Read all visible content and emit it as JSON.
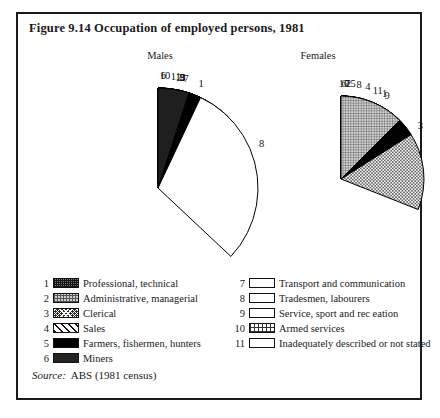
{
  "figure": {
    "title": "Figure 9.14  Occupation of employed persons, 1981",
    "source_label": "Source:",
    "source_value": "ABS (1981 census)"
  },
  "panels": {
    "males_heading": "Males",
    "females_heading": "Females"
  },
  "legend": {
    "left": [
      {
        "num": "1",
        "pattern": "p1",
        "label": "Professional, technical"
      },
      {
        "num": "2",
        "pattern": "p2",
        "label": "Administrative, managerial"
      },
      {
        "num": "3",
        "pattern": "p3",
        "label": "Clerical"
      },
      {
        "num": "4",
        "pattern": "p4",
        "label": "Sales"
      },
      {
        "num": "5",
        "pattern": "p5",
        "label": "Farmers, fishermen, hunters"
      },
      {
        "num": "6",
        "pattern": "p6",
        "label": "Miners"
      }
    ],
    "right": [
      {
        "num": "7",
        "pattern": "p7",
        "label": "Transport and communication"
      },
      {
        "num": "8",
        "pattern": "p8",
        "label": "Tradesmen, labourers"
      },
      {
        "num": "9",
        "pattern": "p9",
        "label": "Service, sport and rec eation"
      },
      {
        "num": "10",
        "pattern": "p10",
        "label": "Armed services"
      },
      {
        "num": "11",
        "pattern": "p11",
        "label": "Inadequately described or not stated"
      }
    ]
  },
  "chart_data": [
    {
      "type": "pie",
      "title": "Males",
      "start_angle_deg": 0,
      "direction": "clockwise",
      "radius_px": 100,
      "categories": [
        "1",
        "2",
        "3",
        "4",
        "5",
        "6",
        "7",
        "8",
        "9",
        "10",
        "11"
      ],
      "labels": [
        "Professional, technical",
        "Administrative, managerial",
        "Clerical",
        "Sales",
        "Farmers, fishermen, hunters",
        "Miners",
        "Transport and communication",
        "Tradesmen, labourers",
        "Service, sport and rec eation",
        "Armed services",
        "Inadequately described or not stated"
      ],
      "values": [
        12.5,
        6.0,
        7.0,
        7.0,
        7.0,
        1.5,
        8.0,
        37.0,
        7.0,
        2.0,
        5.0
      ],
      "patterns": [
        "p1",
        "p2",
        "p3",
        "p4",
        "p5",
        "p6",
        "p5",
        "p8",
        "p5",
        "p10",
        "p6"
      ]
    },
    {
      "type": "pie",
      "title": "Females",
      "start_angle_deg": 0,
      "direction": "clockwise",
      "radius_px": 83,
      "categories": [
        "1",
        "2",
        "3",
        "4",
        "5",
        "6",
        "7",
        "8",
        "9",
        "10",
        "11"
      ],
      "labels": [
        "Professional, technical",
        "Administrative, managerial",
        "Clerical",
        "Sales",
        "Farmers, fishermen, hunters",
        "Miners",
        "Transport and communication",
        "Tradesmen, labourers",
        "Service, sport and rec eation",
        "Armed services",
        "Inadequately described or not stated"
      ],
      "values": [
        15.0,
        2.5,
        31.0,
        9.0,
        4.0,
        1.0,
        2.0,
        6.0,
        16.0,
        1.0,
        12.5
      ],
      "patterns": [
        "p1",
        "p2",
        "p3",
        "p4",
        "p5",
        "p6",
        "p7",
        "p8",
        "p5",
        "p6",
        "p2"
      ]
    }
  ]
}
